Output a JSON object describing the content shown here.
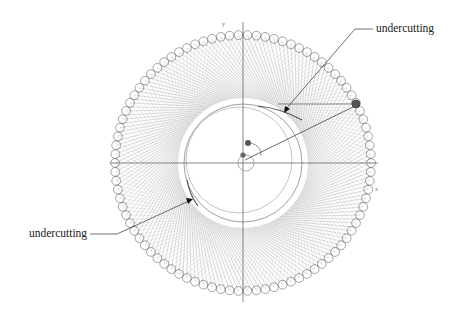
{
  "diagram": {
    "title": "",
    "center": {
      "x": 243,
      "y": 163
    },
    "outer_ring_radius": 128,
    "inner_circle_radius": 59,
    "roller_count": 90,
    "generating_line_count": 180,
    "colors": {
      "lines": "#9a9a9a",
      "rollers": "#6a6a6a",
      "axes": "#555555",
      "text": "#1a1a1a",
      "highlight_roller": "#444444"
    },
    "axes": {
      "x_label": "x",
      "y_label": "y"
    },
    "annotations": [
      {
        "id": "top-right",
        "text": "undercutting"
      },
      {
        "id": "bottom-left",
        "text": "undercutting"
      }
    ]
  }
}
